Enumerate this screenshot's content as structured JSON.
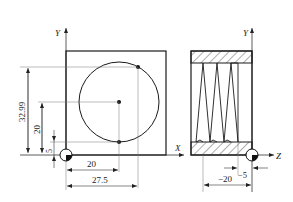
{
  "left_view": {
    "axis_y_label": "Y",
    "axis_x_label": "X",
    "dimensions": {
      "vertical_outer": "32.99",
      "vertical_center": "20",
      "vertical_bottom_point": "5",
      "horizontal_center": "20",
      "horizontal_tangent": "27.5"
    }
  },
  "right_view": {
    "axis_y_label": "Y",
    "axis_z_label": "Z",
    "dimensions": {
      "depth_small": "−5",
      "depth_total": "−20"
    }
  },
  "colors": {
    "line": "#1a1a1a",
    "thin_line": "#555555",
    "background": "#ffffff"
  }
}
